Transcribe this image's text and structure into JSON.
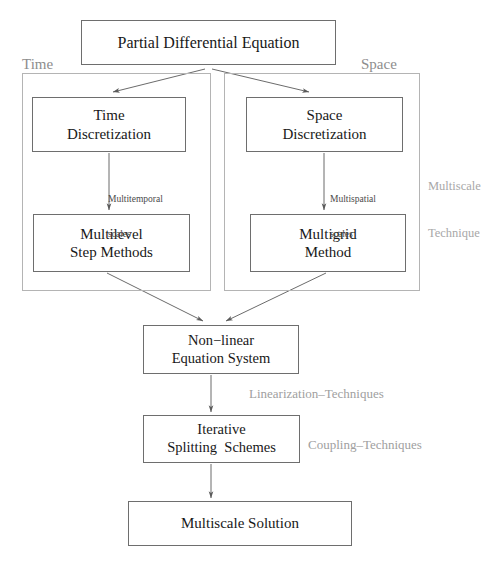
{
  "diagram": {
    "title_node": {
      "text": "Partial Differential Equation"
    },
    "groups": {
      "time": {
        "label": "Time"
      },
      "space": {
        "label": "Space"
      }
    },
    "nodes": {
      "time_discretization": {
        "line1": "Time",
        "line2": "Discretization"
      },
      "space_discretization": {
        "line1": "Space",
        "line2": "Discretization"
      },
      "multilevel_step_methods": {
        "line1": "Multilevel",
        "line2": "Step Methods"
      },
      "multigrid_method": {
        "line1": "Multigrid",
        "line2": "Method"
      },
      "nonlinear_equation_system": {
        "line1": "Non−linear",
        "line2": "Equation System"
      },
      "iterative_splitting_schemes": {
        "line1": "Iterative",
        "line2": "Splitting  Schemes"
      },
      "multiscale_solution": {
        "line1": "Multiscale Solution"
      }
    },
    "edge_labels": {
      "multitemporal": {
        "line1": "Multitemporal",
        "line2": "scales"
      },
      "multispatial": {
        "line1": "Multispatial",
        "line2": "scales"
      },
      "linearization": {
        "text": "Linearization–Techniques"
      },
      "coupling": {
        "text": "Coupling–Techniques"
      },
      "multiscale_technique": {
        "line1": "Multiscale",
        "line2": "Technique"
      }
    },
    "colors": {
      "node_border": "#6e6e6e",
      "group_border": "#b4b4b4",
      "node_text": "#181818",
      "group_label": "#8d8d8d",
      "side_label": "#a0a0a0",
      "edge_label": "#4a4a4a",
      "arrow": "#5a5a5a",
      "background": "#ffffff"
    }
  }
}
